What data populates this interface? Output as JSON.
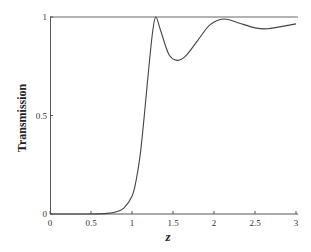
{
  "chart_data": {
    "type": "line",
    "title": "",
    "xlabel": "z",
    "ylabel": "Transmission",
    "xlim": [
      0,
      3
    ],
    "ylim": [
      0,
      1
    ],
    "grid": false,
    "legend": null,
    "x_ticks": [
      0,
      0.5,
      1,
      1.5,
      2,
      2.5,
      3
    ],
    "x_tick_labels": [
      "0",
      "0.5",
      "1",
      "1.5",
      "2",
      "2.5",
      "3"
    ],
    "y_ticks": [
      0,
      0.5,
      1
    ],
    "y_tick_labels": [
      "0",
      "0.5",
      "1"
    ],
    "reference_lines": [
      {
        "orientation": "horizontal",
        "y": 1
      }
    ],
    "series": [
      {
        "name": "Transmission",
        "color": "#444444",
        "x": [
          0,
          0.5,
          0.7,
          0.8,
          0.9,
          1.0,
          1.05,
          1.1,
          1.15,
          1.2,
          1.25,
          1.29,
          1.35,
          1.45,
          1.55,
          1.65,
          1.8,
          1.95,
          2.12,
          2.3,
          2.5,
          2.65,
          2.8,
          3.0
        ],
        "y": [
          0,
          0,
          0.003,
          0.01,
          0.03,
          0.09,
          0.17,
          0.3,
          0.5,
          0.72,
          0.92,
          1.0,
          0.93,
          0.81,
          0.78,
          0.8,
          0.88,
          0.96,
          0.99,
          0.97,
          0.945,
          0.94,
          0.95,
          0.965
        ]
      }
    ]
  },
  "axes": {
    "x_label": "z",
    "y_label": "Transmission"
  }
}
